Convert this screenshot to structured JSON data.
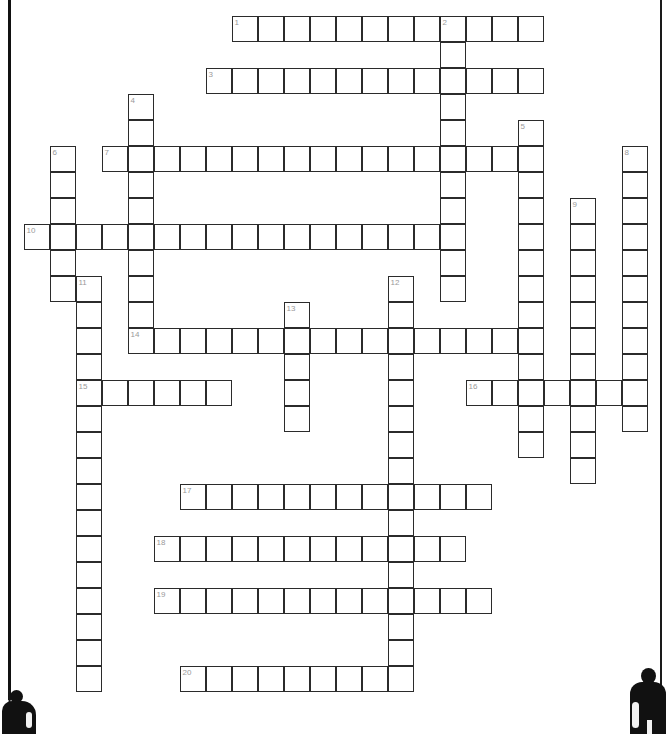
{
  "puzzle": {
    "title": "Crossword Puzzle Grid",
    "cell_size": 26,
    "grid_origin": {
      "x": 24,
      "y": 16
    },
    "columns": 25,
    "rows": 26,
    "numbers": [
      {
        "n": "1",
        "col": 8,
        "row": 0
      },
      {
        "n": "2",
        "col": 16,
        "row": 0
      },
      {
        "n": "3",
        "col": 7,
        "row": 2
      },
      {
        "n": "4",
        "col": 4,
        "row": 3
      },
      {
        "n": "5",
        "col": 19,
        "row": 4
      },
      {
        "n": "6",
        "col": 1,
        "row": 5
      },
      {
        "n": "7",
        "col": 3,
        "row": 5
      },
      {
        "n": "8",
        "col": 23,
        "row": 5
      },
      {
        "n": "9",
        "col": 21,
        "row": 7
      },
      {
        "n": "10",
        "col": 0,
        "row": 8
      },
      {
        "n": "11",
        "col": 2,
        "row": 10
      },
      {
        "n": "12",
        "col": 14,
        "row": 10
      },
      {
        "n": "13",
        "col": 10,
        "row": 11
      },
      {
        "n": "14",
        "col": 4,
        "row": 12
      },
      {
        "n": "15",
        "col": 2,
        "row": 14
      },
      {
        "n": "16",
        "col": 17,
        "row": 14
      },
      {
        "n": "17",
        "col": 6,
        "row": 18
      },
      {
        "n": "18",
        "col": 5,
        "row": 20
      },
      {
        "n": "19",
        "col": 5,
        "row": 22
      },
      {
        "n": "20",
        "col": 6,
        "row": 25
      }
    ],
    "across_entries": [
      {
        "clue_number": "1",
        "col": 8,
        "row": 0,
        "length": 12
      },
      {
        "clue_number": "3",
        "col": 7,
        "row": 2,
        "length": 13
      },
      {
        "clue_number": "7",
        "col": 3,
        "row": 5,
        "length": 16
      },
      {
        "clue_number": "10",
        "col": 0,
        "row": 8,
        "length": 17
      },
      {
        "clue_number": "14",
        "col": 4,
        "row": 12,
        "length": 15
      },
      {
        "clue_number": "15",
        "col": 2,
        "row": 14,
        "length": 6
      },
      {
        "clue_number": "16",
        "col": 17,
        "row": 14,
        "length": 7
      },
      {
        "clue_number": "17",
        "col": 6,
        "row": 18,
        "length": 12
      },
      {
        "clue_number": "18",
        "col": 5,
        "row": 20,
        "length": 12
      },
      {
        "clue_number": "19",
        "col": 5,
        "row": 22,
        "length": 13
      },
      {
        "clue_number": "20",
        "col": 6,
        "row": 25,
        "length": 9
      }
    ],
    "down_entries": [
      {
        "clue_number": "2",
        "col": 16,
        "row": 0,
        "length": 11
      },
      {
        "clue_number": "4",
        "col": 4,
        "row": 3,
        "length": 10
      },
      {
        "clue_number": "5",
        "col": 19,
        "row": 4,
        "length": 13
      },
      {
        "clue_number": "6",
        "col": 1,
        "row": 5,
        "length": 6
      },
      {
        "clue_number": "8",
        "col": 23,
        "row": 5,
        "length": 11
      },
      {
        "clue_number": "9",
        "col": 21,
        "row": 7,
        "length": 11
      },
      {
        "clue_number": "11",
        "col": 2,
        "row": 10,
        "length": 16
      },
      {
        "clue_number": "12",
        "col": 14,
        "row": 10,
        "length": 16
      },
      {
        "clue_number": "13",
        "col": 10,
        "row": 11,
        "length": 5
      }
    ]
  }
}
